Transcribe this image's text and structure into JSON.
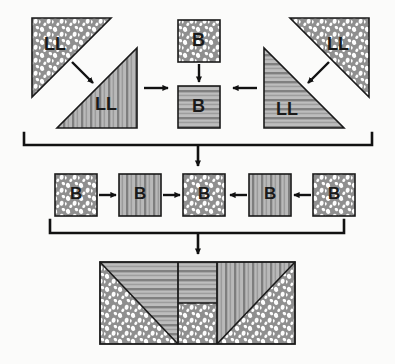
{
  "diagram": {
    "fabrics": {
      "dotted": {
        "name": "dotted",
        "base_color": "#8f8f8f",
        "dot_color": "#fdfdfd"
      },
      "vertical_stripe": {
        "name": "vertical-stripe",
        "light_color": "#b9b9b9",
        "dark_color": "#7e7e7e"
      },
      "horizontal_stripe": {
        "name": "horizontal-stripe",
        "light_color": "#bdbdbd",
        "dark_color": "#808080"
      }
    },
    "outline_color": "#1a1a1a",
    "arrow_color": "#111111",
    "background_color": "#fbfbfa"
  },
  "row1": {
    "name": "triangle-units-row",
    "left_group": {
      "triangle_dotted": {
        "label": "LL",
        "fabric": "dotted"
      },
      "triangle_striped": {
        "label": "LL",
        "fabric": "vertical_stripe"
      },
      "arrow_in": "arrow-down-right",
      "arrow_out": "arrow-right"
    },
    "center_group": {
      "square_top": {
        "label": "B",
        "fabric": "dotted"
      },
      "square_bottom": {
        "label": "B",
        "fabric": "horizontal_stripe"
      },
      "arrow": "arrow-down"
    },
    "right_group": {
      "triangle_dotted": {
        "label": "LL",
        "fabric": "dotted"
      },
      "triangle_striped": {
        "label": "LL",
        "fabric": "horizontal_stripe"
      },
      "arrow_in": "arrow-down-left",
      "arrow_out": "arrow-left"
    }
  },
  "bracket1": {
    "name": "bracket-row1-to-row2",
    "arrow": "arrow-down"
  },
  "row2": {
    "name": "square-strip-row",
    "squares": [
      {
        "label": "B",
        "fabric": "dotted"
      },
      {
        "label": "B",
        "fabric": "vertical_stripe"
      },
      {
        "label": "B",
        "fabric": "dotted"
      },
      {
        "label": "B",
        "fabric": "vertical_stripe"
      },
      {
        "label": "B",
        "fabric": "dotted"
      }
    ],
    "arrows": [
      "arrow-right",
      "arrow-right",
      "arrow-left",
      "arrow-left"
    ]
  },
  "bracket2": {
    "name": "bracket-row2-to-row3",
    "arrow": "arrow-down"
  },
  "row3": {
    "name": "finished-block",
    "sections": [
      {
        "name": "left-section",
        "upper_triangle_fabric": "horizontal_stripe",
        "lower_triangle_fabric": "dotted"
      },
      {
        "name": "center-section",
        "top_fabric": "horizontal_stripe",
        "bottom_fabric": "dotted"
      },
      {
        "name": "right-section",
        "upper_triangle_fabric": "vertical_stripe",
        "lower_triangle_fabric": "dotted"
      }
    ]
  }
}
